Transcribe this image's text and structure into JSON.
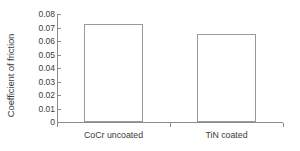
{
  "chart_data": {
    "type": "bar",
    "title": "",
    "subtitle": "",
    "xlabel": "",
    "ylabel": "Coefficient of friction",
    "categories": [
      "CoCr uncoated",
      "TiN coated"
    ],
    "values": [
      0.0725,
      0.065
    ],
    "series": [
      {
        "name": "Coefficient of friction",
        "values": [
          0.0725,
          0.065
        ]
      }
    ],
    "ylim": [
      0,
      0.08
    ],
    "ytick_values": [
      0,
      0.01,
      0.02,
      0.03,
      0.04,
      0.05,
      0.06,
      0.07,
      0.08
    ],
    "ytick_labels": [
      "0",
      "0.01",
      "0.02",
      "0.03",
      "0.04",
      "0.05",
      "0.06",
      "0.07",
      "0.08"
    ],
    "grid": false,
    "legend": false,
    "legend_position": "none",
    "bar_fill_color": "#ffffff",
    "bar_edge_color": "#9a9a9a",
    "axis_color": "#8c8c8c",
    "text_color": "#3b3b3b",
    "background_color": "#ffffff"
  }
}
